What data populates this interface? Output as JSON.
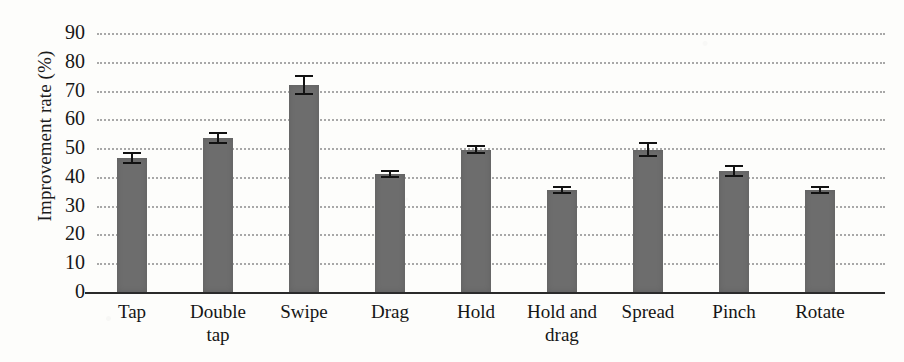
{
  "chart_data": {
    "type": "bar",
    "title": "",
    "xlabel": "",
    "ylabel": "Improvement rate (%)",
    "ylim": [
      0,
      90
    ],
    "ytick_labels": [
      "90",
      "80",
      "70",
      "60",
      "50",
      "40",
      "30",
      "20",
      "10",
      "0"
    ],
    "ytick_values": [
      90,
      80,
      70,
      60,
      50,
      40,
      30,
      20,
      10,
      0
    ],
    "grid": "horizontal-dotted",
    "legend": "none",
    "categories": [
      "Tap",
      "Double tap",
      "Swipe",
      "Drag",
      "Hold",
      "Hold and drag",
      "Spread",
      "Pinch",
      "Rotate"
    ],
    "category_lines": [
      [
        "Tap",
        ""
      ],
      [
        "Double",
        "tap"
      ],
      [
        "Swipe",
        ""
      ],
      [
        "Drag",
        ""
      ],
      [
        "Hold",
        ""
      ],
      [
        "Hold and",
        "drag"
      ],
      [
        "Spread",
        ""
      ],
      [
        "Pinch",
        ""
      ],
      [
        "Rotate",
        ""
      ]
    ],
    "values": [
      46.5,
      53.5,
      72.0,
      41.0,
      49.5,
      35.5,
      49.5,
      42.0,
      35.5
    ],
    "errors": [
      2.0,
      2.0,
      3.5,
      1.5,
      1.5,
      1.5,
      2.5,
      2.0,
      1.5
    ],
    "bar_color": "#6d6d6d",
    "error_color": "#121212",
    "grid_color": "#9a9a9a",
    "axis_color": "#2a2a2a"
  }
}
